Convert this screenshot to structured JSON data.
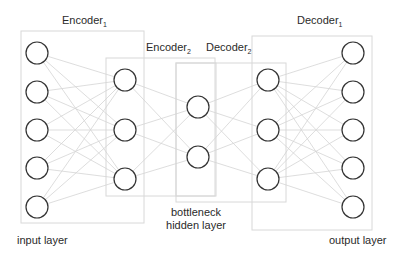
{
  "diagram": {
    "type": "autoencoder",
    "labels": {
      "encoder1": {
        "text": "Encoder",
        "sub": "1"
      },
      "encoder2": {
        "text": "Encoder",
        "sub": "2"
      },
      "decoder2": {
        "text": "Decoder",
        "sub": "2"
      },
      "decoder1": {
        "text": "Decoder",
        "sub": "1"
      },
      "input_layer": "input layer",
      "bottleneck_line1": "bottleneck",
      "bottleneck_line2": "hidden layer",
      "output_layer": "output layer"
    },
    "layers": [
      {
        "name": "input",
        "nodes": 5
      },
      {
        "name": "encoder-hidden",
        "nodes": 3
      },
      {
        "name": "bottleneck",
        "nodes": 2
      },
      {
        "name": "decoder-hidden",
        "nodes": 3
      },
      {
        "name": "output",
        "nodes": 5
      }
    ],
    "colors": {
      "node_stroke": "#333333",
      "edge": "#d4d4d4",
      "box": "#d8d8d8",
      "text": "#2a2a2a"
    }
  }
}
